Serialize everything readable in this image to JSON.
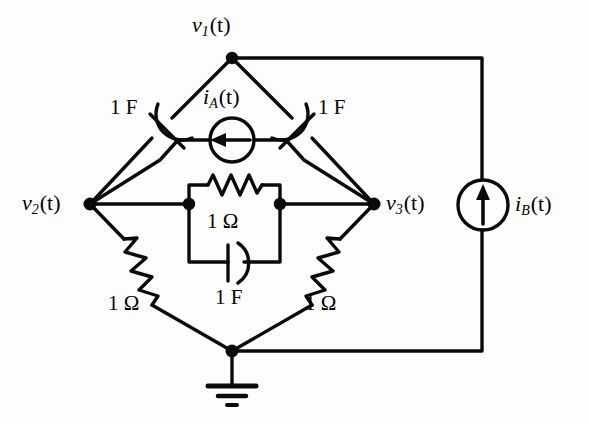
{
  "diagram": {
    "type": "electrical-circuit",
    "background_color": "#fdfdfd",
    "line_color": "#000000"
  },
  "nodes": [
    {
      "id": "v1",
      "label_var": "v",
      "label_sub": "1",
      "label_arg": "(t)",
      "text": "v1(t)",
      "x": 232,
      "y": 58
    },
    {
      "id": "v2",
      "label_var": "v",
      "label_sub": "2",
      "label_arg": "(t)",
      "text": "v2(t)",
      "x": 90,
      "y": 204
    },
    {
      "id": "v3",
      "label_var": "v",
      "label_sub": "3",
      "label_arg": "(t)",
      "text": "v3(t)",
      "x": 374,
      "y": 204
    },
    {
      "id": "gnd",
      "label_var": "",
      "label_sub": "",
      "label_arg": "",
      "text": "ground",
      "x": 232,
      "y": 351
    },
    {
      "id": "mid_left",
      "text": "center-block-left",
      "x": 189,
      "y": 204
    },
    {
      "id": "mid_right",
      "text": "center-block-right",
      "x": 280,
      "y": 204
    }
  ],
  "sources": [
    {
      "id": "iA",
      "name_var": "i",
      "name_sub": "A",
      "name_arg": "(t)",
      "text": "iA(t)",
      "kind": "current-source",
      "arrow_direction": "left",
      "cx": 232,
      "cy": 140,
      "r": 22,
      "label_x": 205,
      "label_y": 85
    },
    {
      "id": "iB",
      "name_var": "i",
      "name_sub": "B",
      "name_arg": "(t)",
      "text": "iB(t)",
      "kind": "current-source",
      "arrow_direction": "up",
      "cx": 483,
      "cy": 205,
      "r": 25,
      "label_x": 515,
      "label_y": 192
    }
  ],
  "components": [
    {
      "id": "c_left",
      "kind": "capacitor",
      "value": "1 F",
      "value_num": 1,
      "unit": "F",
      "label_x": 113,
      "label_y": 100
    },
    {
      "id": "c_right",
      "kind": "capacitor",
      "value": "1 F",
      "value_num": 1,
      "unit": "F",
      "label_x": 320,
      "label_y": 100
    },
    {
      "id": "r_center",
      "kind": "resistor",
      "value": "1 Ω",
      "value_num": 1,
      "unit": "Ω",
      "label_x": 208,
      "label_y": 214
    },
    {
      "id": "c_center",
      "kind": "capacitor",
      "value": "1 F",
      "value_num": 1,
      "unit": "F",
      "label_x": 216,
      "label_y": 285
    },
    {
      "id": "r_left",
      "kind": "resistor",
      "value": "1 Ω",
      "value_num": 1,
      "unit": "Ω",
      "label_x": 110,
      "label_y": 295
    },
    {
      "id": "r_right",
      "kind": "resistor",
      "value": "1 Ω",
      "value_num": 1,
      "unit": "Ω",
      "label_x": 306,
      "label_y": 295
    }
  ],
  "labels": {
    "v1": "v",
    "v1_sub": "1",
    "v1_arg": "(t)",
    "v2": "v",
    "v2_sub": "2",
    "v2_arg": "(t)",
    "v3": "v",
    "v3_sub": "3",
    "v3_arg": "(t)",
    "iA": "i",
    "iA_sub": "A",
    "iA_arg": "(t)",
    "iB": "i",
    "iB_sub": "B",
    "iB_arg": "(t)",
    "c_left_value": "1 F",
    "c_right_value": "1 F",
    "c_center_value": "1 F",
    "r_center_value": "1 Ω",
    "r_left_value": "1 Ω",
    "r_right_value": "1 Ω"
  }
}
